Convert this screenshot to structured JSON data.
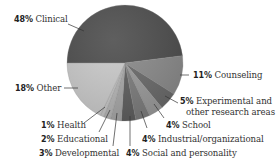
{
  "chart_data": {
    "type": "pie",
    "title": "",
    "start_angle_deg": 180,
    "direction": "clockwise",
    "slices": [
      {
        "label": "Clinical",
        "pct_label": "48%",
        "value": 48,
        "color": "#4d4d4d"
      },
      {
        "label": "Counseling",
        "pct_label": "11%",
        "value": 11,
        "color": "#8a8a8a"
      },
      {
        "label": "Experimental and other research areas",
        "pct_label": "5%",
        "value": 5,
        "color": "#6a6a6a"
      },
      {
        "label": "School",
        "pct_label": "4%",
        "value": 4,
        "color": "#9a9a9a"
      },
      {
        "label": "Industrial/organizational",
        "pct_label": "4%",
        "value": 4,
        "color": "#7c7c7c"
      },
      {
        "label": "Social and personality",
        "pct_label": "4%",
        "value": 4,
        "color": "#5e5e5e"
      },
      {
        "label": "Developmental",
        "pct_label": "3%",
        "value": 3,
        "color": "#a6a6a6"
      },
      {
        "label": "Educational",
        "pct_label": "2%",
        "value": 2,
        "color": "#b4b4b4"
      },
      {
        "label": "Health",
        "pct_label": "1%",
        "value": 1,
        "color": "#c4c4c4"
      },
      {
        "label": "Other",
        "pct_label": "18%",
        "value": 18,
        "color": "#c9c9c9"
      }
    ],
    "legend": "none (callout labels)"
  },
  "labels": {
    "clinical": {
      "pct": "48%",
      "text": " Clinical"
    },
    "counseling": {
      "pct": "11%",
      "text": " Counseling"
    },
    "experimental": {
      "pct": "5%",
      "text": " Experimental and",
      "text2": "other research areas"
    },
    "school": {
      "pct": "4%",
      "text": " School"
    },
    "industrial": {
      "pct": "4%",
      "text": " Industrial/organizational"
    },
    "social": {
      "pct": "4%",
      "text": " Social and personality"
    },
    "developmental": {
      "pct": "3%",
      "text": " Developmental"
    },
    "educational": {
      "pct": "2%",
      "text": " Educational"
    },
    "health": {
      "pct": "1%",
      "text": " Health"
    },
    "other": {
      "pct": "18%",
      "text": " Other"
    }
  }
}
